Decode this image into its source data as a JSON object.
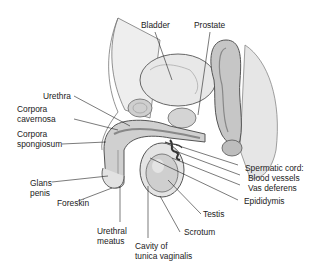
{
  "diagram": {
    "labels": {
      "bladder": "Bladder",
      "prostate": "Prostate",
      "urethra": "Urethra",
      "corpora_cavernosa_1": "Corpora",
      "corpora_cavernosa_2": "cavernosa",
      "corpora_spongiosum_1": "Corpora",
      "corpora_spongiosum_2": "spongiosum",
      "glans_penis_1": "Glans",
      "glans_penis_2": "penis",
      "foreskin": "Foreskin",
      "urethral_meatus_1": "Urethral",
      "urethral_meatus_2": "meatus",
      "cavity_tunica_1": "Cavity of",
      "cavity_tunica_2": "tunica vaginalis",
      "scrotum": "Scrotum",
      "testis": "Testis",
      "epididymis": "Epididymis",
      "spermatic_cord": "Spermatic cord:",
      "blood_vessels": "Blood vessels",
      "vas_deferens": "Vas deferens"
    },
    "colors": {
      "tissue_fill": "#d9d9d9",
      "tissue_dark": "#9a9a9a",
      "outline": "#555555",
      "leader": "#222222"
    }
  }
}
